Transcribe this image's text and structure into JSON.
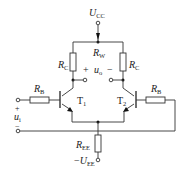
{
  "diagram": {
    "type": "differential-amplifier-circuit",
    "supply_positive": {
      "symbol": "U",
      "sub": "CC"
    },
    "supply_negative": {
      "prefix": "−",
      "symbol": "U",
      "sub": "EE"
    },
    "potentiometer": {
      "symbol": "R",
      "sub": "W"
    },
    "collector_resistor_left": {
      "symbol": "R",
      "sub": "C"
    },
    "collector_resistor_right": {
      "symbol": "R",
      "sub": "C"
    },
    "base_resistor_left": {
      "symbol": "R",
      "sub": "B"
    },
    "base_resistor_right": {
      "symbol": "R",
      "sub": "B"
    },
    "emitter_resistor": {
      "symbol": "R",
      "sub": "EE"
    },
    "transistor_left": {
      "symbol": "T",
      "sub": "1"
    },
    "transistor_right": {
      "symbol": "T",
      "sub": "2"
    },
    "output": {
      "plus": "+",
      "symbol": "u",
      "sub": "o",
      "minus": "−"
    },
    "input": {
      "plus": "+",
      "symbol": "u",
      "sub": "i",
      "minus": "−"
    }
  }
}
